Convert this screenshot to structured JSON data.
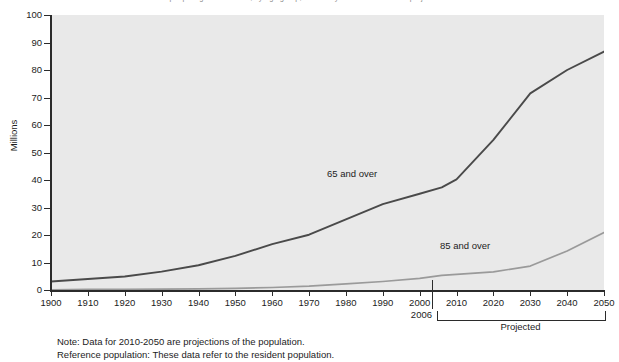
{
  "chart_data": {
    "type": "line",
    "title": "Number of people age 65 and over, by age group, selected years 1900-2006 and projected 2010-2050",
    "xlabel": "",
    "ylabel": "Millions",
    "ylim": [
      0,
      100
    ],
    "xlim": [
      1900,
      2050
    ],
    "y_ticks": [
      0,
      10,
      20,
      30,
      40,
      50,
      60,
      70,
      80,
      90,
      100
    ],
    "x_ticks": [
      1900,
      1910,
      1920,
      1930,
      1940,
      1950,
      1960,
      1970,
      1980,
      1990,
      2000,
      2010,
      2020,
      2030,
      2040,
      2050
    ],
    "grid": false,
    "legend_position": "in-plot-annotations",
    "x": [
      1900,
      1910,
      1920,
      1930,
      1940,
      1950,
      1960,
      1970,
      1980,
      1990,
      2000,
      2006,
      2010,
      2020,
      2030,
      2040,
      2050
    ],
    "series": [
      {
        "name": "65 and over",
        "color": "#4a4a4a",
        "values": [
          3.1,
          4.0,
          4.9,
          6.7,
          9.0,
          12.4,
          16.7,
          20.1,
          25.7,
          31.2,
          35.0,
          37.3,
          40.2,
          54.6,
          71.5,
          80.0,
          86.7
        ]
      },
      {
        "name": "85 and over",
        "color": "#9a9a9a",
        "values": [
          0.1,
          0.2,
          0.2,
          0.3,
          0.4,
          0.6,
          0.9,
          1.4,
          2.2,
          3.1,
          4.2,
          5.3,
          5.7,
          6.6,
          8.7,
          14.2,
          20.9
        ]
      }
    ],
    "annotations": [
      {
        "text": "65 and over",
        "x": 1990,
        "y": 44
      },
      {
        "text": "85 and over",
        "x": 2022,
        "y": 17
      }
    ],
    "markers": [
      {
        "label": "2006",
        "x": 2006,
        "type": "vertical-divider"
      }
    ],
    "brackets": [
      {
        "label": "Projected",
        "from": 2010,
        "to": 2050
      }
    ]
  },
  "axes": {
    "y_title": "Millions",
    "y_tick_labels": [
      "100",
      "90",
      "80",
      "70",
      "60",
      "50",
      "40",
      "30",
      "20",
      "10",
      "0"
    ],
    "x_tick_labels": [
      "1900",
      "1910",
      "1920",
      "1930",
      "1940",
      "1950",
      "1960",
      "1970",
      "1980",
      "1990",
      "2000",
      "2010",
      "2020",
      "2030",
      "2040",
      "2050"
    ]
  },
  "marker": {
    "label_2006": "2006"
  },
  "bracket": {
    "projected_label": "Projected"
  },
  "labels": {
    "series_65": "65 and over",
    "series_85": "85 and over"
  },
  "footnotes": {
    "note": "Note: Data for 2010-2050 are projections of the population.",
    "reference": "Reference population: These data refer to the resident population."
  },
  "colors": {
    "plot_background": "#e9e9e9",
    "page_background": "#ffffff",
    "axis": "#2b2b2b",
    "series_65_line": "#4a4a4a",
    "series_85_line": "#9a9a9a",
    "text": "#1c1c1c"
  }
}
